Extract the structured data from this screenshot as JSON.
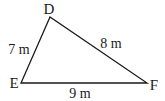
{
  "diagram": {
    "type": "triangle",
    "vertices": [
      {
        "label": "D",
        "x": 50,
        "y": 17,
        "lx": 49,
        "ly": 14
      },
      {
        "label": "E",
        "x": 21,
        "y": 83,
        "lx": 14,
        "ly": 88
      },
      {
        "label": "F",
        "x": 147,
        "y": 83,
        "lx": 154,
        "ly": 90
      }
    ],
    "sides": [
      {
        "name": "DE",
        "label": "7 m",
        "lx": 19,
        "ly": 54
      },
      {
        "name": "DF",
        "label": "8 m",
        "lx": 111,
        "ly": 48
      },
      {
        "name": "EF",
        "label": "9 m",
        "lx": 80,
        "ly": 98
      }
    ],
    "stroke_color": "#1a1a1a"
  }
}
